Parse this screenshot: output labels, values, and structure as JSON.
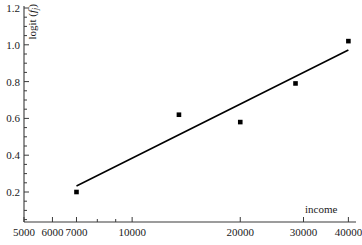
{
  "chart_data": {
    "type": "scatter",
    "title": "",
    "xlabel": "income",
    "ylabel": "logit (f j)",
    "ylabel_parts": {
      "main": "logit (",
      "italic": "f",
      "subscript": "j",
      "close": ")"
    },
    "xscale": "log",
    "yscale": "linear",
    "xlim": [
      5000,
      42000
    ],
    "ylim": [
      0.0,
      1.24
    ],
    "grid": false,
    "legend": false,
    "x": [
      7000,
      13500,
      20000,
      28500,
      40000
    ],
    "values": [
      0.2,
      0.62,
      0.58,
      0.79,
      1.02
    ],
    "points": [
      {
        "x": 7000,
        "y": 0.2
      },
      {
        "x": 13500,
        "y": 0.62
      },
      {
        "x": 20000,
        "y": 0.58
      },
      {
        "x": 28500,
        "y": 0.79
      },
      {
        "x": 40000,
        "y": 1.02
      }
    ],
    "series": [
      {
        "name": "data points",
        "type": "scatter",
        "marker": "square",
        "color": "#000000",
        "values": [
          0.2,
          0.62,
          0.58,
          0.79,
          1.02
        ]
      },
      {
        "name": "fitted line",
        "type": "line",
        "color": "#000000",
        "endpoints": [
          {
            "x": 7000,
            "y": 0.233
          },
          {
            "x": 40000,
            "y": 0.972
          }
        ]
      }
    ],
    "xticks_major": [
      {
        "value": 5000,
        "label": "5000"
      },
      {
        "value": 6000,
        "label": "6000"
      },
      {
        "value": 7000,
        "label": "7000"
      },
      {
        "value": 10000,
        "label": "10000"
      },
      {
        "value": 20000,
        "label": "20000"
      },
      {
        "value": 30000,
        "label": "30000"
      },
      {
        "value": 40000,
        "label": "40000"
      }
    ],
    "yticks_major": [
      {
        "value": 0.2,
        "label": "0.2"
      },
      {
        "value": 0.4,
        "label": "0.4"
      },
      {
        "value": 0.6,
        "label": "0.6"
      },
      {
        "value": 0.8,
        "label": "0.8"
      },
      {
        "value": 1.0,
        "label": "1.0"
      },
      {
        "value": 1.2,
        "label": "1.2"
      }
    ],
    "colors": {
      "axis": "#3a3a3a",
      "marker": "#000000",
      "line": "#000000",
      "background": "#ffffff"
    }
  }
}
